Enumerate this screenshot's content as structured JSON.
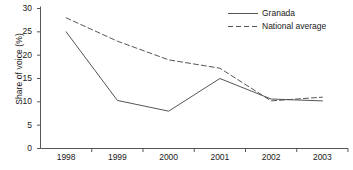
{
  "chart_data": {
    "type": "line",
    "title": "",
    "xlabel": "",
    "ylabel": "Share of voice (%)",
    "categories": [
      "1998",
      "1999",
      "2000",
      "2001",
      "2002",
      "2003"
    ],
    "x": [
      1998,
      1999,
      2000,
      2001,
      2002,
      2003
    ],
    "ylim": [
      0,
      30
    ],
    "yticks": [
      0,
      5,
      10,
      15,
      20,
      25,
      30
    ],
    "ytick_labels": [
      "0",
      "5",
      "10",
      "15",
      "20",
      "25",
      "30"
    ],
    "grid": false,
    "legend_position": "top-right",
    "series": [
      {
        "name": "Granada",
        "style": "solid",
        "color": "#555555",
        "values": [
          25.0,
          10.3,
          8.0,
          15.0,
          10.6,
          10.2
        ]
      },
      {
        "name": "National average",
        "style": "dashed",
        "color": "#555555",
        "values": [
          28.0,
          23.0,
          19.0,
          17.2,
          10.2,
          11.0
        ]
      }
    ]
  },
  "axis": {
    "line_color": "#555555"
  }
}
